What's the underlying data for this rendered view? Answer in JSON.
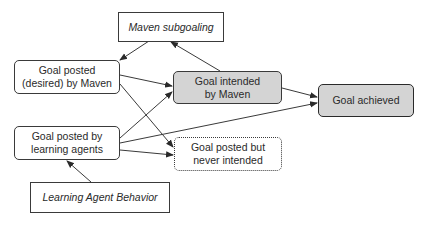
{
  "diagram": {
    "type": "flowchart",
    "nodes": [
      {
        "id": "maven_subgoaling",
        "label": "Maven subgoaling",
        "style": "rectangle-italic"
      },
      {
        "id": "goal_posted_maven",
        "label": "Goal posted\n(desired) by Maven",
        "line1": "Goal posted",
        "line2": "(desired) by Maven",
        "style": "rounded"
      },
      {
        "id": "goal_intended",
        "label": "Goal intended\nby Maven",
        "line1": "Goal intended",
        "line2": "by Maven",
        "style": "rounded-gray"
      },
      {
        "id": "goal_achieved",
        "label": "Goal achieved",
        "style": "rounded-gray-thick"
      },
      {
        "id": "goal_posted_agents",
        "label": "Goal posted by\nlearning agents",
        "line1": "Goal posted by",
        "line2": "learning agents",
        "style": "rounded"
      },
      {
        "id": "goal_never_intended",
        "label": "Goal posted but\nnever intended",
        "line1": "Goal posted but",
        "line2": "never intended",
        "style": "rounded-dashed"
      },
      {
        "id": "learning_agent_behavior",
        "label": "Learning Agent Behavior",
        "style": "rectangle-italic"
      }
    ],
    "edges": [
      {
        "from": "maven_subgoaling",
        "to": "goal_posted_maven"
      },
      {
        "from": "goal_intended",
        "to": "maven_subgoaling"
      },
      {
        "from": "goal_posted_maven",
        "to": "goal_intended"
      },
      {
        "from": "goal_posted_maven",
        "to": "goal_never_intended"
      },
      {
        "from": "goal_posted_agents",
        "to": "goal_intended"
      },
      {
        "from": "goal_posted_agents",
        "to": "goal_achieved"
      },
      {
        "from": "goal_posted_agents",
        "to": "goal_never_intended"
      },
      {
        "from": "goal_intended",
        "to": "goal_achieved"
      },
      {
        "from": "learning_agent_behavior",
        "to": "goal_posted_agents"
      }
    ],
    "colors": {
      "border": "#3a3a3a",
      "gray_fill": "#d4d4d4",
      "background": "#ffffff"
    }
  }
}
